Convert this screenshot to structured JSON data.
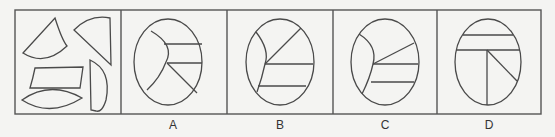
{
  "puzzle": {
    "description": "Figure reasoning: which figure can be assembled from the five given pieces",
    "panels": [
      {
        "id": "question",
        "label": "",
        "content": "five-pieces"
      },
      {
        "id": "A",
        "label": "A"
      },
      {
        "id": "B",
        "label": "B"
      },
      {
        "id": "C",
        "label": "C"
      },
      {
        "id": "D",
        "label": "D"
      }
    ]
  },
  "colors": {
    "background": "#f4f4f2",
    "stroke": "#4a4a4a"
  }
}
